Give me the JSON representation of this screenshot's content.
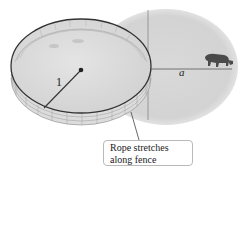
{
  "figure": {
    "labels": {
      "rope_radius": "1",
      "distance": "a"
    },
    "callout": {
      "line1": "Rope stretches",
      "line2": "along fence"
    },
    "icons": {
      "animal": "cow-icon",
      "fence": "circular-fence",
      "pasture": "grazing-region"
    },
    "colors": {
      "pasture": "#d8d8d8",
      "fence_rim": "#3a3a3a",
      "fence_grid": "#9a9a9a",
      "axis": "#777777",
      "callout_border": "#b9b9b9"
    }
  }
}
